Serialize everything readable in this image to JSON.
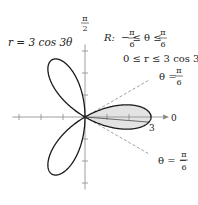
{
  "chart_data": {
    "type": "line",
    "subtype": "polar",
    "equation_label": "r = 3 cos 3θ",
    "function": {
      "a": 3,
      "n": 3
    },
    "theta_range": [
      0,
      3.14159265
    ],
    "region": {
      "label_prefix": "R:",
      "theta_min_num": "π",
      "theta_min_den": "6",
      "theta_max_num": "π",
      "theta_max_den": "6",
      "ineq_theta": "−  ≤ θ ≤",
      "ineq_r": "0 ≤ r ≤ 3 cos 3θ",
      "theta_min": -0.5235988,
      "theta_max": 0.5235988,
      "fill_color": "#e3e3e3"
    },
    "rays": [
      {
        "name": "theta-pi-over-6",
        "theta": 0.5235988,
        "label": "θ =",
        "num": "π",
        "den": "6"
      },
      {
        "name": "theta-minus-pi-over-6",
        "theta": -0.5235988,
        "label": "θ = −",
        "num": "π",
        "den": "6"
      }
    ],
    "axes": {
      "polar_axis_label": "0",
      "vertical_axis_num": "π",
      "vertical_axis_den": "2",
      "r_tick_label": "3",
      "ticks_x": [
        -3,
        -2,
        -1,
        1,
        2,
        3
      ],
      "ticks_y": [
        -3,
        -2,
        -1,
        1,
        2,
        3
      ],
      "range": [
        -3.3,
        3.3
      ]
    },
    "colors": {
      "curve": "#1a1a1a",
      "axis": "#888888",
      "ray": "#8a8a8a"
    }
  }
}
